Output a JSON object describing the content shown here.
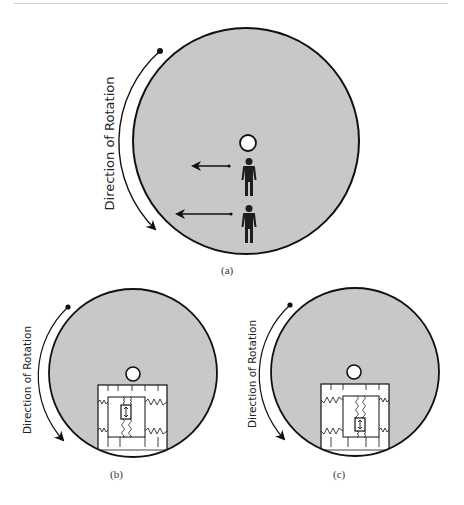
{
  "figure": {
    "panel_a": {
      "caption": "(a)",
      "rotation_label": "Direction of Rotation",
      "elements": [
        "rotating-disc",
        "hub",
        "person-inner",
        "person-outer",
        "force-arrow-short",
        "force-arrow-long",
        "rotation-arrow"
      ]
    },
    "panel_b": {
      "caption": "(b)",
      "rotation_label": "Direction of Rotation",
      "elements": [
        "rotating-disc",
        "hub",
        "spring-mass-box",
        "sensor-near-top"
      ]
    },
    "panel_c": {
      "caption": "(c)",
      "rotation_label": "Direction of Rotation",
      "elements": [
        "rotating-disc",
        "hub",
        "spring-mass-box",
        "sensor-near-bottom"
      ]
    },
    "colors": {
      "disc_fill": "#c8c8c8",
      "outline": "#111111",
      "hub_fill": "#ffffff",
      "person": "#1e1e1e"
    }
  }
}
